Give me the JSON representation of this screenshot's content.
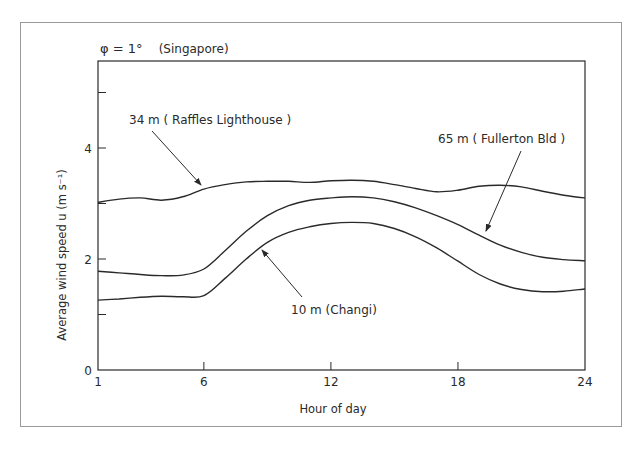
{
  "chart_data": {
    "type": "line",
    "title": "φ = 1°  (Singapore)",
    "xlabel": "Hour of day",
    "ylabel": "Average wind speed u (m s⁻¹)",
    "xlim": [
      1,
      24
    ],
    "ylim": [
      0,
      5.65
    ],
    "xticks": [
      1,
      6,
      12,
      18,
      24
    ],
    "xtick_labels": [
      "1",
      "6",
      "12",
      "18",
      "24"
    ],
    "yticks": [
      0,
      1,
      2,
      3,
      4,
      5
    ],
    "ytick_labels": [
      "0",
      "",
      "2",
      "",
      "4",
      ""
    ],
    "grid": false,
    "legend": "inline annotations with arrows",
    "x": [
      1,
      2,
      3,
      4,
      5,
      6,
      7,
      8,
      9,
      10,
      11,
      12,
      13,
      14,
      15,
      16,
      17,
      18,
      19,
      20,
      21,
      22,
      23,
      24
    ],
    "series": [
      {
        "name": "34 m (Raffles Lighthouse)",
        "values": [
          3.02,
          3.08,
          3.1,
          3.06,
          3.12,
          3.26,
          3.34,
          3.39,
          3.4,
          3.4,
          3.38,
          3.41,
          3.42,
          3.4,
          3.34,
          3.27,
          3.21,
          3.24,
          3.31,
          3.33,
          3.3,
          3.22,
          3.15,
          3.1
        ]
      },
      {
        "name": "65 m (Fullerton Bld)",
        "values": [
          1.78,
          1.75,
          1.72,
          1.7,
          1.71,
          1.82,
          2.15,
          2.5,
          2.78,
          2.96,
          3.06,
          3.1,
          3.12,
          3.1,
          3.03,
          2.92,
          2.78,
          2.62,
          2.43,
          2.25,
          2.12,
          2.03,
          1.99,
          1.97
        ]
      },
      {
        "name": "10 m (Changi)",
        "values": [
          1.26,
          1.28,
          1.31,
          1.33,
          1.32,
          1.34,
          1.65,
          2.0,
          2.3,
          2.48,
          2.58,
          2.64,
          2.66,
          2.64,
          2.55,
          2.4,
          2.2,
          1.96,
          1.72,
          1.55,
          1.45,
          1.41,
          1.42,
          1.46
        ]
      }
    ],
    "annotations": [
      {
        "text": "34 m ( Raffles Lighthouse )",
        "arrow_to_hour": 6,
        "series": "34 m (Raffles Lighthouse)"
      },
      {
        "text": "65 m ( Fullerton Bld )",
        "arrow_to_hour": 19,
        "series": "65 m (Fullerton Bld)"
      },
      {
        "text": "10 m (Changi)",
        "arrow_to_hour": 8.7,
        "series": "10 m (Changi)"
      }
    ]
  },
  "labels": {
    "phi_title": "φ = 1°",
    "location": "(Singapore)",
    "ylabel": "Average wind speed u (m s⁻¹)",
    "xlabel": "Hour of day",
    "ann_34": "34 m ( Raffles Lighthouse )",
    "ann_65": "65 m ( Fullerton Bld )",
    "ann_10": "10 m (Changi)"
  },
  "colors": {
    "line": "#2a2a2a",
    "frame": "#9a9a9a",
    "background": "#ffffff"
  }
}
